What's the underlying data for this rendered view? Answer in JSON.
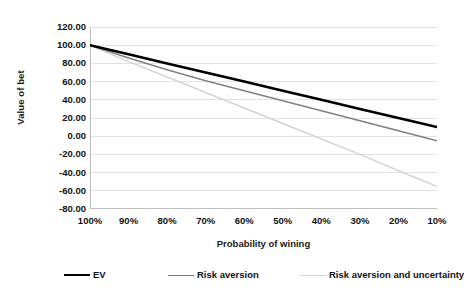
{
  "chart_data": {
    "type": "line",
    "title": "",
    "xlabel": "Probability of wining",
    "ylabel": "Value of bet",
    "categories": [
      "100%",
      "90%",
      "80%",
      "70%",
      "60%",
      "50%",
      "40%",
      "30%",
      "20%",
      "10%"
    ],
    "x_values": [
      100,
      90,
      80,
      70,
      60,
      50,
      40,
      30,
      20,
      10
    ],
    "ylim": [
      -80,
      120
    ],
    "y_ticks": [
      120.0,
      100.0,
      80.0,
      60.0,
      40.0,
      20.0,
      0.0,
      -20.0,
      -40.0,
      -60.0,
      -80.0
    ],
    "y_tick_labels": [
      "120.00",
      "100.00",
      "80.00",
      "60.00",
      "40.00",
      "20.00",
      "0.00",
      "-20.00",
      "-40.00",
      "-60.00",
      "-80.00"
    ],
    "grid": true,
    "legend_position": "bottom",
    "series": [
      {
        "name": "EV",
        "color": "#000000",
        "width": 2.6,
        "values": [
          100.0,
          90.0,
          80.0,
          70.0,
          60.0,
          50.0,
          40.0,
          30.0,
          20.0,
          10.0
        ]
      },
      {
        "name": "Risk aversion",
        "color": "#808080",
        "width": 1.5,
        "values": [
          100.0,
          86.0,
          73.0,
          61.0,
          50.0,
          39.0,
          28.0,
          17.0,
          6.0,
          -5.0
        ]
      },
      {
        "name": "Risk aversion and uncertainty",
        "color": "#d4d4d4",
        "width": 1.5,
        "values": [
          100.0,
          82.0,
          65.0,
          48.0,
          31.0,
          14.0,
          -3.0,
          -20.0,
          -38.0,
          -55.0
        ]
      }
    ]
  },
  "axes": {
    "y_title": "Value of bet",
    "x_title": "Probability of wining",
    "y_ticks": [
      "120.00",
      "100.00",
      "80.00",
      "60.00",
      "40.00",
      "20.00",
      "0.00",
      "-20.00",
      "-40.00",
      "-60.00",
      "-80.00"
    ],
    "x_ticks": [
      "100%",
      "90%",
      "80%",
      "70%",
      "60%",
      "50%",
      "40%",
      "30%",
      "20%",
      "10%"
    ]
  },
  "legend": {
    "items": [
      {
        "label": "EV",
        "color": "#000000"
      },
      {
        "label": "Risk aversion",
        "color": "#808080"
      },
      {
        "label": "Risk aversion and uncertainty",
        "color": "#d4d4d4"
      }
    ]
  },
  "colors": {
    "background": "#ffffff",
    "grid": "#e3e3e3",
    "axis": "#bfbfbf",
    "text": "#111111"
  }
}
